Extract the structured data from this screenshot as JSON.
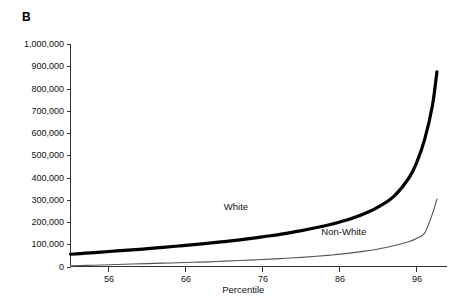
{
  "figure": {
    "panel_label": "B"
  },
  "chart_data": {
    "type": "line",
    "title": "",
    "subtitle": "",
    "xlabel": "Percentile",
    "ylabel": "",
    "xlim": [
      51,
      99
    ],
    "ylim": [
      0,
      1000000
    ],
    "grid": false,
    "legend_position": "inline-annotation",
    "x_ticks": [
      56,
      66,
      76,
      86,
      96
    ],
    "x_tick_labels": [
      "56",
      "66",
      "76",
      "86",
      "96"
    ],
    "y_ticks": [
      0,
      100000,
      200000,
      300000,
      400000,
      500000,
      600000,
      700000,
      800000,
      900000,
      1000000
    ],
    "y_tick_labels": [
      "0",
      "100,000",
      "200,000",
      "300,000",
      "400,000",
      "500,000",
      "600,000",
      "700,000",
      "800,000",
      "900,000",
      "1,000,000"
    ],
    "annotations": [
      {
        "text": "White",
        "x": 72.5,
        "y": 255000
      },
      {
        "text": "Non-White",
        "x": 86.5,
        "y": 140000
      }
    ],
    "x": [
      51,
      53,
      55,
      57,
      59,
      61,
      63,
      65,
      67,
      69,
      71,
      73,
      75,
      77,
      79,
      81,
      83,
      85,
      87,
      89,
      91,
      93,
      95,
      96,
      97,
      98,
      98.6
    ],
    "series": [
      {
        "name": "White",
        "color": "#000000",
        "line_width": "thick",
        "values": [
          55000,
          60000,
          65000,
          70000,
          75000,
          80000,
          86000,
          92000,
          98000,
          105000,
          112000,
          120000,
          129000,
          138000,
          149000,
          161000,
          175000,
          191000,
          210000,
          235000,
          268000,
          315000,
          400000,
          470000,
          570000,
          720000,
          875000
        ]
      },
      {
        "name": "Non-White",
        "color": "#555555",
        "line_width": "thin",
        "values": [
          3000,
          5000,
          7000,
          9000,
          11000,
          13000,
          15000,
          17000,
          19000,
          21000,
          24000,
          27000,
          30000,
          33000,
          37000,
          41000,
          46000,
          52000,
          59000,
          68000,
          79000,
          93000,
          112000,
          127000,
          150000,
          235000,
          303000
        ]
      }
    ]
  }
}
